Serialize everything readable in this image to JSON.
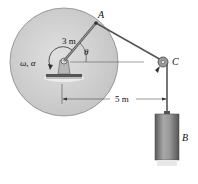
{
  "labels": {
    "point_a": "A",
    "point_c": "C",
    "block_b": "B",
    "angular": "ω, α",
    "angle": "θ",
    "radius": "3 m",
    "distance": "5 m"
  },
  "colors": {
    "disk": "#d4d4d4",
    "disk_edge": "#8a8a8a",
    "cable": "#555555",
    "block": "#8c8c8c",
    "block_dark": "#5f5f5f"
  }
}
